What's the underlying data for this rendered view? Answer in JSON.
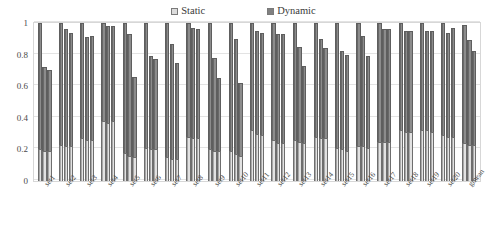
{
  "legend": {
    "position": "top-center",
    "entries": [
      {
        "label": "Static",
        "color": "#e2e2e2",
        "marker": "square-outline-icon"
      },
      {
        "label": "Dynamic",
        "color": "#8c8c8c",
        "marker": "square-filled-icon"
      }
    ]
  },
  "axes": {
    "y_tick_labels": [
      "0",
      "0.2",
      "0.4",
      "0.6",
      "0.8",
      "1"
    ],
    "y_label": "",
    "x_label": ""
  },
  "chart_data": {
    "type": "bar",
    "title": "",
    "subtitle": "",
    "xlabel": "",
    "ylabel": "",
    "ylim": [
      0,
      1
    ],
    "yticks": [
      0,
      0.2,
      0.4,
      0.6,
      0.8,
      1
    ],
    "grid": true,
    "stacked": true,
    "bars_per_group": 3,
    "legend_position": "top-center",
    "categories": [
      "set1",
      "set2",
      "set3",
      "set4",
      "set5",
      "set6",
      "set7",
      "set8",
      "set9",
      "set10",
      "set11",
      "set12",
      "set13",
      "set14",
      "set15",
      "set16",
      "set17",
      "set18",
      "set19",
      "set20",
      "gmean"
    ],
    "series": [
      {
        "name": "Static",
        "color": "#e2e2e2",
        "values": [
          [
            0.2,
            0.19,
            0.19
          ],
          [
            0.23,
            0.22,
            0.22
          ],
          [
            0.27,
            0.26,
            0.26
          ],
          [
            0.38,
            0.37,
            0.38
          ],
          [
            0.18,
            0.16,
            0.15
          ],
          [
            0.21,
            0.2,
            0.2
          ],
          [
            0.15,
            0.14,
            0.14
          ],
          [
            0.28,
            0.27,
            0.27
          ],
          [
            0.2,
            0.19,
            0.19
          ],
          [
            0.19,
            0.17,
            0.16
          ],
          [
            0.32,
            0.3,
            0.29
          ],
          [
            0.26,
            0.24,
            0.24
          ],
          [
            0.26,
            0.25,
            0.24
          ],
          [
            0.28,
            0.27,
            0.27
          ],
          [
            0.21,
            0.2,
            0.19
          ],
          [
            0.22,
            0.22,
            0.21
          ],
          [
            0.25,
            0.25,
            0.25
          ],
          [
            0.32,
            0.31,
            0.31
          ],
          [
            0.32,
            0.32,
            0.31
          ],
          [
            0.29,
            0.28,
            0.28
          ],
          [
            0.24,
            0.23,
            0.23
          ]
        ]
      },
      {
        "name": "Dynamic",
        "color": "#8c8c8c",
        "values": [
          [
            0.8,
            0.53,
            0.51
          ],
          [
            0.77,
            0.74,
            0.72
          ],
          [
            0.73,
            0.65,
            0.66
          ],
          [
            0.62,
            0.61,
            0.6
          ],
          [
            0.82,
            0.77,
            0.51
          ],
          [
            0.79,
            0.59,
            0.57
          ],
          [
            0.85,
            0.73,
            0.61
          ],
          [
            0.72,
            0.7,
            0.69
          ],
          [
            0.8,
            0.59,
            0.46
          ],
          [
            0.81,
            0.73,
            0.46
          ],
          [
            0.68,
            0.65,
            0.65
          ],
          [
            0.74,
            0.69,
            0.69
          ],
          [
            0.74,
            0.6,
            0.49
          ],
          [
            0.72,
            0.63,
            0.57
          ],
          [
            0.79,
            0.62,
            0.61
          ],
          [
            0.78,
            0.7,
            0.58
          ],
          [
            0.75,
            0.71,
            0.71
          ],
          [
            0.68,
            0.64,
            0.64
          ],
          [
            0.68,
            0.63,
            0.64
          ],
          [
            0.71,
            0.66,
            0.69
          ],
          [
            0.75,
            0.66,
            0.59
          ]
        ]
      }
    ],
    "totals": [
      [
        1.0,
        0.72,
        0.7
      ],
      [
        1.0,
        0.96,
        0.94
      ],
      [
        1.0,
        0.91,
        0.92
      ],
      [
        1.0,
        0.98,
        0.98
      ],
      [
        1.0,
        0.93,
        0.66
      ],
      [
        1.0,
        0.79,
        0.77
      ],
      [
        1.0,
        0.87,
        0.75
      ],
      [
        1.0,
        0.97,
        0.96
      ],
      [
        1.0,
        0.78,
        0.65
      ],
      [
        1.0,
        0.9,
        0.62
      ],
      [
        1.0,
        0.95,
        0.94
      ],
      [
        1.0,
        0.93,
        0.93
      ],
      [
        1.0,
        0.85,
        0.73
      ],
      [
        1.0,
        0.9,
        0.84
      ],
      [
        1.0,
        0.82,
        0.8
      ],
      [
        1.0,
        0.92,
        0.79
      ],
      [
        1.0,
        0.96,
        0.96
      ],
      [
        1.0,
        0.95,
        0.95
      ],
      [
        1.0,
        0.95,
        0.95
      ],
      [
        1.0,
        0.94,
        0.97
      ],
      [
        0.99,
        0.89,
        0.82
      ]
    ]
  }
}
